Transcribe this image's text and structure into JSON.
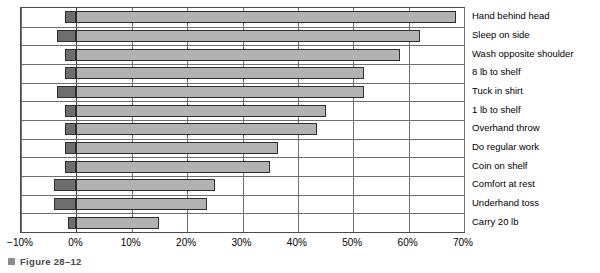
{
  "figure": {
    "caption": "Figure 28–12",
    "bullet_icon": "square-bullet-icon"
  },
  "colors": {
    "positive_segment": "#b2b2b2",
    "negative_segment": "#6e6e6e",
    "bar_outline": "#2e2e2e",
    "grid": "#707070",
    "frame": "#4a4a4a"
  },
  "chart_data": {
    "type": "bar",
    "orientation": "horizontal",
    "title": "",
    "subtitle": "",
    "xlabel": "",
    "ylabel": "",
    "xlim": [
      -10,
      70
    ],
    "ylim": null,
    "grid": true,
    "legend": null,
    "legend_position": "none",
    "xticks": [
      -10,
      0,
      10,
      20,
      30,
      40,
      50,
      60,
      70
    ],
    "xticklabels": [
      "−10%",
      "0%",
      "10%",
      "20%",
      "30%",
      "40%",
      "50%",
      "60%",
      "70%"
    ],
    "categories": [
      "Hand behind head",
      "Sleep on side",
      "Wash opposite shoulder",
      "8 lb to shelf",
      "Tuck in shirt",
      "1 lb to shelf",
      "Overhand throw",
      "Do regular work",
      "Coin on shelf",
      "Comfort at rest",
      "Underhand toss",
      "Carry 20 lb"
    ],
    "series": [
      {
        "name": "Negative",
        "values": [
          -2.0,
          -3.5,
          -2.0,
          -2.0,
          -3.5,
          -2.0,
          -2.0,
          -2.0,
          -2.0,
          -4.0,
          -4.0,
          -1.5
        ]
      },
      {
        "name": "Positive",
        "values": [
          68.5,
          62.0,
          58.5,
          52.0,
          52.0,
          45.0,
          43.5,
          36.5,
          35.0,
          25.0,
          23.5,
          15.0
        ]
      }
    ]
  }
}
